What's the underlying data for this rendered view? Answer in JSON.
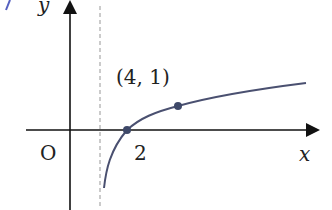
{
  "graph": {
    "function": "y = log_3(x - 1)",
    "asymptote": "x = 1",
    "axis_labels": {
      "x": "x",
      "y": "y"
    },
    "origin_label": "O",
    "tick_label_x": "2",
    "point_labels": [
      "(4, 1)"
    ],
    "points": [
      {
        "x": 2,
        "y": 0
      },
      {
        "x": 4,
        "y": 1
      }
    ],
    "colors": {
      "curve": "#4a5070",
      "axis": "#111111",
      "asymptote": "#b0b0b0",
      "point": "#3e4868"
    }
  }
}
